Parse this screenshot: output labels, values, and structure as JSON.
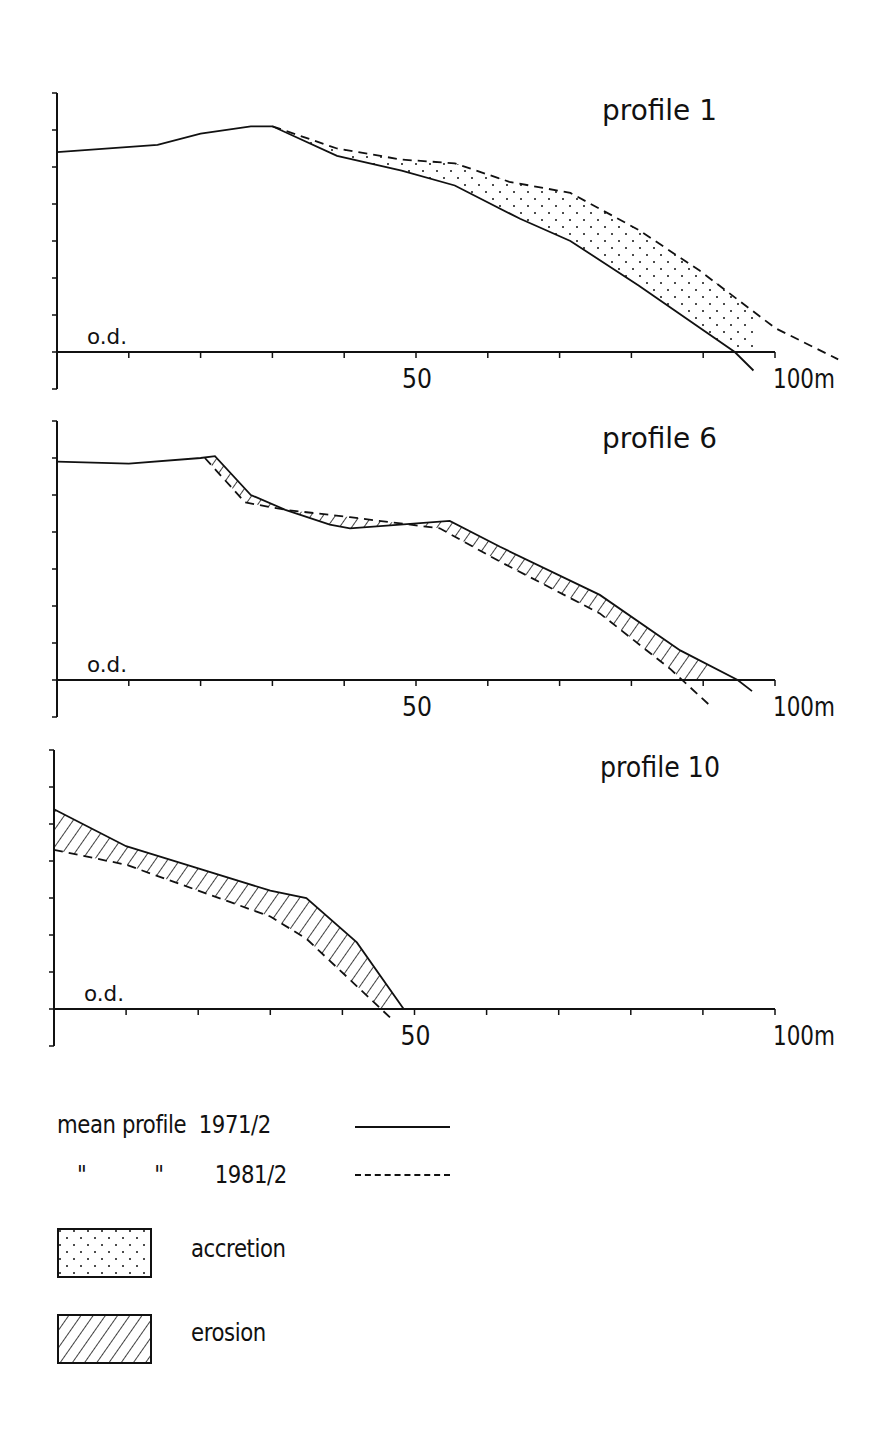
{
  "chart_data": [
    {
      "type": "line",
      "title": "profile 1",
      "xlabel": "m",
      "ylabel": "",
      "datum_label": "o.d.",
      "x_ticks": [
        0,
        10,
        20,
        30,
        40,
        50,
        60,
        70,
        80,
        90,
        100
      ],
      "x_tick_labels": {
        "50": "50",
        "100": "100m"
      },
      "xlim": [
        0,
        100
      ],
      "ylim": [
        -1,
        7
      ],
      "y_ticks": [
        -1,
        0,
        1,
        2,
        3,
        4,
        5,
        6,
        7
      ],
      "shading": "accretion",
      "series": [
        {
          "name": "mean profile 1971/2",
          "style": "solid",
          "points": [
            [
              0,
              5.4
            ],
            [
              14,
              5.6
            ],
            [
              20,
              5.9
            ],
            [
              27,
              6.1
            ],
            [
              30,
              6.1
            ],
            [
              39,
              5.3
            ],
            [
              48,
              4.9
            ],
            [
              55.4,
              4.5
            ],
            [
              64.5,
              3.6
            ],
            [
              71.5,
              3.0
            ],
            [
              81,
              1.8
            ],
            [
              94.4,
              0
            ],
            [
              97,
              -0.5
            ]
          ]
        },
        {
          "name": "mean profile 1981/2",
          "style": "dashed",
          "points": [
            [
              30,
              6.1
            ],
            [
              39,
              5.5
            ],
            [
              48,
              5.2
            ],
            [
              55.4,
              5.1
            ],
            [
              63,
              4.6
            ],
            [
              71.5,
              4.3
            ],
            [
              81,
              3.3
            ],
            [
              89.5,
              2.2
            ],
            [
              100,
              0.65
            ],
            [
              108.8,
              -0.2
            ]
          ]
        }
      ]
    },
    {
      "type": "line",
      "title": "profile 6",
      "xlabel": "m",
      "ylabel": "",
      "datum_label": "o.d.",
      "x_ticks": [
        0,
        10,
        20,
        30,
        40,
        50,
        60,
        70,
        80,
        90,
        100
      ],
      "x_tick_labels": {
        "50": "50",
        "100": "100m"
      },
      "xlim": [
        0,
        100
      ],
      "ylim": [
        -1,
        7
      ],
      "y_ticks": [
        -1,
        0,
        1,
        2,
        3,
        4,
        5,
        6,
        7
      ],
      "shading": "erosion",
      "series": [
        {
          "name": "mean profile 1971/2",
          "style": "solid",
          "points": [
            [
              0,
              5.9
            ],
            [
              10,
              5.85
            ],
            [
              20,
              6.0
            ],
            [
              22,
              6.05
            ],
            [
              27,
              5.0
            ],
            [
              31.8,
              4.6
            ],
            [
              38,
              4.2
            ],
            [
              40.8,
              4.1
            ],
            [
              47.8,
              4.2
            ],
            [
              54.7,
              4.3
            ],
            [
              61.7,
              3.6
            ],
            [
              75.6,
              2.3
            ],
            [
              86.8,
              0.8
            ],
            [
              94.8,
              0
            ],
            [
              96.8,
              -0.3
            ]
          ]
        },
        {
          "name": "mean profile 1981/2",
          "style": "dashed",
          "points": [
            [
              20.6,
              6.0
            ],
            [
              26.2,
              4.8
            ],
            [
              31.8,
              4.6
            ],
            [
              40.8,
              4.4
            ],
            [
              53.3,
              4.1
            ],
            [
              61.7,
              3.2
            ],
            [
              75.6,
              1.8
            ],
            [
              85.4,
              0.3
            ],
            [
              91,
              -0.7
            ]
          ]
        }
      ]
    },
    {
      "type": "line",
      "title": "profile 10",
      "xlabel": "m",
      "ylabel": "",
      "datum_label": "o.d.",
      "x_ticks": [
        0,
        10,
        20,
        30,
        40,
        50,
        60,
        70,
        80,
        90,
        100
      ],
      "x_tick_labels": {
        "50": "50",
        "100": "100m"
      },
      "xlim": [
        0,
        100
      ],
      "ylim": [
        -1,
        7
      ],
      "y_ticks": [
        -1,
        0,
        1,
        2,
        3,
        4,
        5,
        6,
        7
      ],
      "shading": "erosion",
      "series": [
        {
          "name": "mean profile 1971/2",
          "style": "solid",
          "points": [
            [
              0,
              5.4
            ],
            [
              10,
              4.4
            ],
            [
              20,
              3.8
            ],
            [
              30,
              3.2
            ],
            [
              35,
              3.0
            ],
            [
              42,
              1.8
            ],
            [
              48.5,
              0
            ]
          ]
        },
        {
          "name": "mean profile 1981/2",
          "style": "dashed",
          "points": [
            [
              0,
              4.3
            ],
            [
              10,
              3.9
            ],
            [
              20,
              3.2
            ],
            [
              30,
              2.5
            ],
            [
              35,
              1.9
            ],
            [
              44,
              0.25
            ],
            [
              47,
              -0.3
            ]
          ]
        }
      ]
    }
  ],
  "legend": {
    "row1": {
      "a": "mean profile",
      "b": "1971/2"
    },
    "row2": {
      "a": "\"",
      "b": "\"",
      "c": "1981/2"
    },
    "accretion": "accretion",
    "erosion": "erosion"
  }
}
